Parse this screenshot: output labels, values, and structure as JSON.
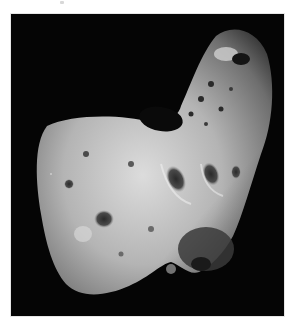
{
  "figure": {
    "alt": "Grayscale photograph of an elongated, cratered asteroid against a black sky",
    "colors": {
      "background": "#050505",
      "surface_light": "#d9d9d9",
      "surface_mid": "#8f8f8f",
      "surface_dark": "#3a3a3a",
      "page": "#ffffff"
    }
  }
}
